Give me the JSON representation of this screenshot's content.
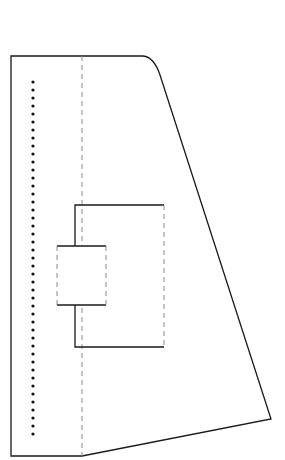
{
  "diagram": {
    "type": "line-drawing",
    "background": "#ffffff",
    "stroke_color": "#1a1a1a",
    "dash_color": "#8a8a8a",
    "outer_shape": {
      "points": [
        [
          11,
          56
        ],
        [
          143,
          56
        ],
        [
          160,
          75
        ],
        [
          271,
          419
        ],
        [
          82,
          456
        ],
        [
          11,
          456
        ]
      ],
      "corner_rounded_at": [
        143,
        56
      ]
    },
    "divider_line": {
      "x": 82,
      "y1": 56,
      "y2": 456,
      "style": "dashed"
    },
    "dot_column": {
      "x": 33,
      "y_start": 82,
      "y_end": 436,
      "spacing": 8,
      "radius": 1.6
    },
    "outer_bracket_box": {
      "x1": 75,
      "y1": 205,
      "x2": 164,
      "y2": 347,
      "right_edge": "dashed"
    },
    "inner_box": {
      "x1": 57,
      "y1": 246,
      "x2": 106,
      "y2": 305,
      "side_edges": "dashed"
    }
  }
}
